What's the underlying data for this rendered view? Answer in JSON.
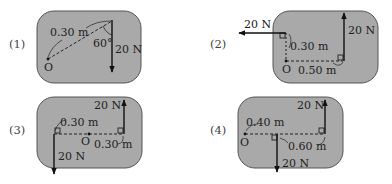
{
  "colors": {
    "panel_fill": "#a9a9a9",
    "panel_stroke": "#555555",
    "ink": "#111111",
    "background": "#ffffff"
  },
  "panels": [
    {
      "number": "(1)",
      "pivot_label": "O",
      "distance_label": "0.30 m",
      "angle_label": "60°",
      "force_label": "20 N"
    },
    {
      "number": "(2)",
      "pivot_label": "O",
      "distance_vertical_label": "0.30 m",
      "distance_horizontal_label": "0.50 m",
      "force_left_label": "20 N",
      "force_up_label": "20 N"
    },
    {
      "number": "(3)",
      "pivot_label": "O",
      "distance_left_label": "0.30 m",
      "distance_right_label": "0.30 m",
      "force_up_label": "20 N",
      "force_down_label": "20 N"
    },
    {
      "number": "(4)",
      "pivot_label": "O",
      "distance_near_label": "0.40 m",
      "distance_far_label": "0.60 m",
      "force_up_label": "20 N",
      "force_down_label": "20 N"
    }
  ]
}
